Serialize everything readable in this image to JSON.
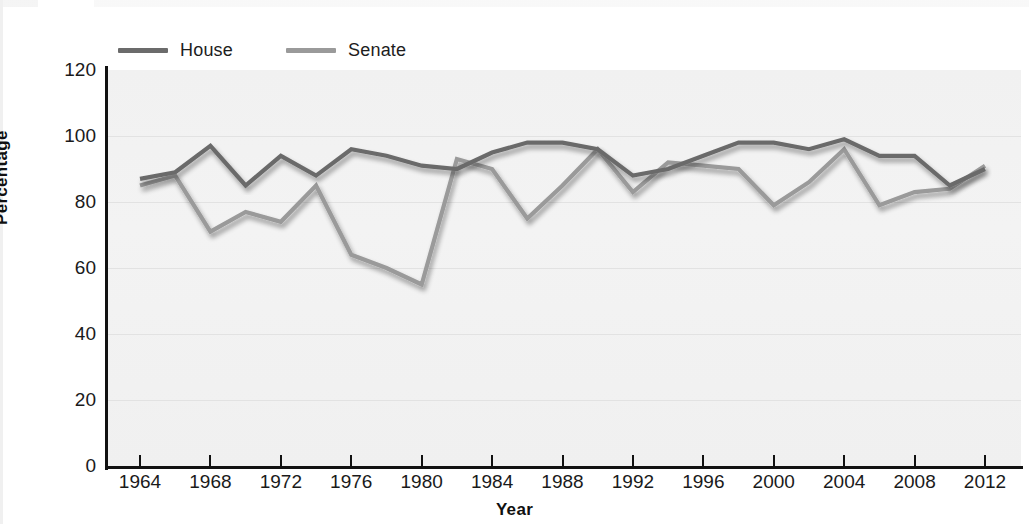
{
  "chart_data": {
    "type": "line",
    "title": "",
    "xlabel": "Year",
    "ylabel": "Percentage",
    "xlim": [
      1964,
      2012
    ],
    "ylim": [
      0,
      120
    ],
    "grid": true,
    "legend_position": "top-left",
    "x_tick_labels": [
      "1964",
      "1968",
      "1972",
      "1976",
      "1980",
      "1984",
      "1988",
      "1992",
      "1996",
      "2000",
      "2004",
      "2008",
      "2012"
    ],
    "y_tick_labels": [
      "0",
      "20",
      "40",
      "60",
      "80",
      "100",
      "120"
    ],
    "x": [
      1964,
      1966,
      1968,
      1970,
      1972,
      1974,
      1976,
      1978,
      1980,
      1982,
      1984,
      1986,
      1988,
      1990,
      1992,
      1994,
      1996,
      1998,
      2000,
      2002,
      2004,
      2006,
      2008,
      2010,
      2012
    ],
    "series": [
      {
        "name": "House",
        "color": "#6b6b6b",
        "values": [
          87,
          89,
          97,
          85,
          94,
          88,
          96,
          94,
          91,
          90,
          95,
          98,
          98,
          96,
          88,
          90,
          94,
          98,
          98,
          96,
          99,
          94,
          94,
          85,
          90
        ]
      },
      {
        "name": "Senate",
        "color": "#9a9a9a",
        "values": [
          85,
          88,
          71,
          77,
          74,
          85,
          64,
          60,
          55,
          93,
          90,
          75,
          85,
          96,
          83,
          92,
          91,
          90,
          79,
          86,
          96,
          79,
          83,
          84,
          91
        ]
      }
    ]
  },
  "legend": {
    "entries": [
      {
        "label": "House",
        "color": "#6b6b6b",
        "swatch_name": "house-line-swatch"
      },
      {
        "label": "Senate",
        "color": "#9a9a9a",
        "swatch_name": "senate-line-swatch"
      }
    ]
  },
  "axes": {
    "y_label": "Percentage",
    "x_label": "Year",
    "y_ticks": [
      "120",
      "100",
      "80",
      "60",
      "40",
      "20",
      "0"
    ],
    "x_ticks": [
      "1964",
      "1968",
      "1972",
      "1976",
      "1980",
      "1984",
      "1988",
      "1992",
      "1996",
      "2000",
      "2004",
      "2008",
      "2012"
    ]
  },
  "colors": {
    "house": "#6b6b6b",
    "senate": "#9a9a9a",
    "plot_background": "#f2f2f2",
    "gridline": "#e2e2e2",
    "axis": "#111111",
    "text": "#1a1a1a"
  }
}
